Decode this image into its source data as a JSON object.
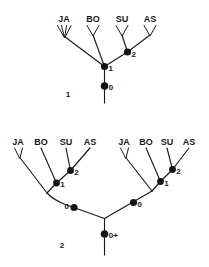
{
  "figure": {
    "background_color": "#ffffff",
    "ink_color": "#1a1a1a",
    "panels": [
      {
        "number": "1",
        "tips": [
          {
            "label": "JA",
            "tip_style": "multi-prong"
          },
          {
            "label": "BO",
            "tip_style": "fork"
          },
          {
            "label": "SU",
            "tip_style": "fork"
          },
          {
            "label": "AS",
            "tip_style": "fork"
          }
        ],
        "nodes": [
          {
            "label": "0"
          },
          {
            "label": "1"
          },
          {
            "label": "2"
          }
        ]
      },
      {
        "number": "2",
        "subtrees": [
          {
            "side": "left",
            "tips": [
              {
                "label": "JA",
                "tip_style": "fork"
              },
              {
                "label": "BO",
                "tip_style": "plain"
              },
              {
                "label": "SU",
                "tip_style": "plain"
              },
              {
                "label": "AS",
                "tip_style": "plain"
              }
            ],
            "nodes": [
              {
                "label": "1"
              },
              {
                "label": "2"
              },
              {
                "label": "0"
              }
            ]
          },
          {
            "side": "right",
            "tips": [
              {
                "label": "JA",
                "tip_style": "fork"
              },
              {
                "label": "BO",
                "tip_style": "plain"
              },
              {
                "label": "SU",
                "tip_style": "plain"
              },
              {
                "label": "AS",
                "tip_style": "plain"
              }
            ],
            "nodes": [
              {
                "label": "1"
              },
              {
                "label": "2"
              },
              {
                "label": "0"
              }
            ]
          }
        ],
        "root_node": {
          "label": "0+"
        }
      }
    ]
  },
  "panel1": {
    "number": "1",
    "tip_ja": "JA",
    "tip_bo": "BO",
    "tip_su": "SU",
    "tip_as": "AS",
    "node_0": "0",
    "node_1": "1",
    "node_2": "2"
  },
  "panel2": {
    "number": "2",
    "left": {
      "tip_ja": "JA",
      "tip_bo": "BO",
      "tip_su": "SU",
      "tip_as": "AS",
      "node_0": "0",
      "node_1": "1",
      "node_2": "2"
    },
    "right": {
      "tip_ja": "JA",
      "tip_bo": "BO",
      "tip_su": "SU",
      "tip_as": "AS",
      "node_0": "0",
      "node_1": "1",
      "node_2": "2"
    },
    "root_node": "0+"
  }
}
